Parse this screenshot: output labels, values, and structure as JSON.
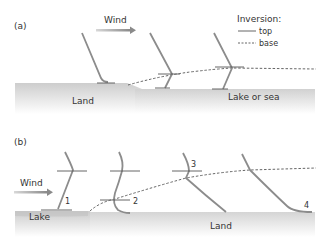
{
  "colors": {
    "profile": "#8c8c8c",
    "tick": "#555555",
    "text": "#333333",
    "ground_top": "#cfcfcf",
    "ground_bottom": "#ffffff",
    "arrow": "#9a9a9a"
  },
  "panel_a": {
    "label": "(a)",
    "wind_label": "Wind",
    "land_label": "Land",
    "water_label": "Lake or sea",
    "legend": {
      "title": "Inversion:",
      "top_label": "top",
      "base_label": "base"
    }
  },
  "panel_b": {
    "label": "(b)",
    "wind_label": "Wind",
    "lake_label": "Lake",
    "land_label": "Land",
    "profile_numbers": [
      "1",
      "2",
      "3",
      "4"
    ]
  }
}
